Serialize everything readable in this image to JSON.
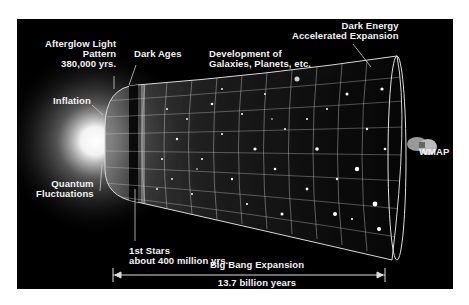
{
  "diagram": {
    "background_color": "#000000",
    "text_color": "#f2f2f2",
    "labels": {
      "afterglow": [
        "Afterglow Light",
        "Pattern",
        "380,000 yrs."
      ],
      "dark_ages": "Dark Ages",
      "development": [
        "Development of",
        "Galaxies, Planets, etc."
      ],
      "dark_energy": [
        "Dark Energy",
        "Accelerated Expansion"
      ],
      "inflation": "Inflation",
      "quantum": [
        "Quantum",
        "Fluctuations"
      ],
      "wmap": "WMAP",
      "first_stars": [
        "1st Stars",
        "about 400 million yrs."
      ],
      "big_bang": "Big Bang Expansion",
      "duration": "13.7 billion years"
    }
  }
}
